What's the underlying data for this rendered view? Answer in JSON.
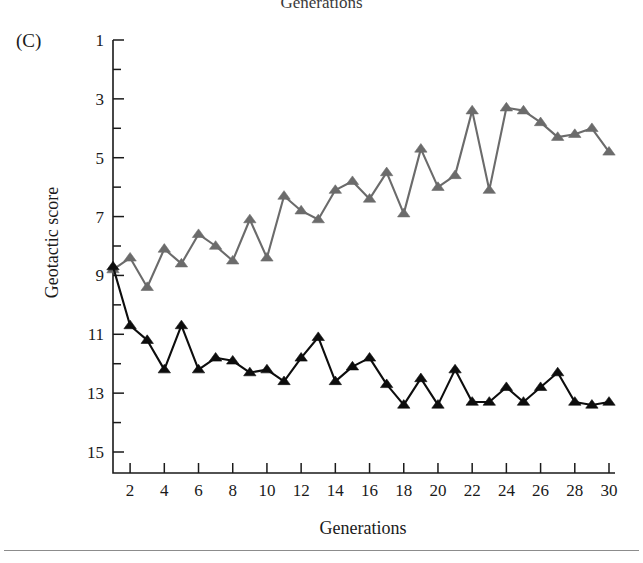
{
  "figure": {
    "panel_label": "(C)",
    "top_cropped_label": "Generations",
    "x_axis_title": "Generations",
    "y_axis_title": "Geotactic score"
  },
  "chart_data": {
    "type": "line",
    "title": "",
    "subtitle": "",
    "xlabel": "Generations",
    "ylabel": "Geotactic score",
    "xlim": [
      1,
      30
    ],
    "ylim": [
      15,
      1
    ],
    "y_inverted": true,
    "grid": false,
    "legend": "none",
    "x_tick_labels": [
      2,
      4,
      6,
      8,
      10,
      12,
      14,
      16,
      18,
      20,
      22,
      24,
      26,
      28,
      30
    ],
    "x_tick_step": 2,
    "x_minor_tick_step": 2,
    "y_tick_labels": [
      1,
      3,
      5,
      7,
      9,
      11,
      13,
      15
    ],
    "y_tick_step": 2,
    "y_minor_tick_step": 1,
    "x": [
      1,
      2,
      3,
      4,
      5,
      6,
      7,
      8,
      9,
      10,
      11,
      12,
      13,
      14,
      15,
      16,
      17,
      18,
      19,
      20,
      21,
      22,
      23,
      24,
      25,
      26,
      27,
      28,
      29,
      30
    ],
    "series": [
      {
        "name": "negative-geotaxis-selected-line",
        "color": "#6b6b6b",
        "marker": "triangle-up",
        "values": [
          8.8,
          8.4,
          9.4,
          8.1,
          8.6,
          7.6,
          8.0,
          8.5,
          7.1,
          8.4,
          6.3,
          6.8,
          7.1,
          6.1,
          5.8,
          6.4,
          5.5,
          6.9,
          4.7,
          6.0,
          5.6,
          3.4,
          6.1,
          3.3,
          3.4,
          3.8,
          4.3,
          4.2,
          4.0,
          4.8
        ]
      },
      {
        "name": "positive-geotaxis-selected-line",
        "color": "#0d0d0d",
        "marker": "triangle-up",
        "values": [
          8.7,
          10.7,
          11.2,
          12.2,
          10.7,
          12.2,
          11.8,
          11.9,
          12.3,
          12.2,
          12.6,
          11.8,
          11.1,
          12.6,
          12.1,
          11.8,
          12.7,
          13.4,
          12.5,
          13.4,
          12.2,
          13.3,
          13.3,
          12.8,
          13.3,
          12.8,
          12.3,
          13.3,
          13.4,
          13.3
        ]
      }
    ]
  }
}
